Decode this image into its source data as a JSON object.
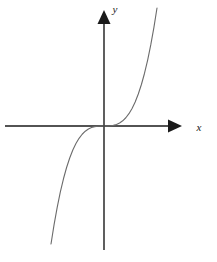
{
  "figure": {
    "width": 217,
    "height": 262,
    "background_color": "#ffffff"
  },
  "chart_data": {
    "type": "line",
    "title": "",
    "subtitle": "",
    "xlabel": "x",
    "ylabel": "y",
    "grid": false,
    "legend": null,
    "annotations": [],
    "tick_labels": {
      "x": [],
      "y": []
    },
    "axes": {
      "style": "arrowed-cartesian-axes",
      "origin_px": {
        "x": 104,
        "y": 126
      },
      "x_axis": {
        "start_px": {
          "x": 5,
          "y": 126
        },
        "end_px": {
          "x": 180,
          "y": 126
        },
        "arrowhead": "right",
        "color": "#1a1a1a",
        "label": "x",
        "label_pos_px": {
          "x": 203,
          "y": 128
        }
      },
      "y_axis": {
        "start_px": {
          "x": 104,
          "y": 250
        },
        "end_px": {
          "x": 104,
          "y": 14
        },
        "arrowhead": "up",
        "color": "#1a1a1a",
        "label": "y",
        "label_pos_px": {
          "x": 114,
          "y": 8
        }
      },
      "xlim": [
        -2.2,
        1.9
      ],
      "ylim": [
        -2.9,
        2.9
      ]
    },
    "series": [
      {
        "name": "y = x^3",
        "equation": "y = x^3",
        "color": "#6b6b6b",
        "line_width": 1.1,
        "x": [
          -1.9,
          -1.8,
          -1.7,
          -1.6,
          -1.5,
          -1.4,
          -1.3,
          -1.2,
          -1.1,
          -1.0,
          -0.9,
          -0.8,
          -0.7,
          -0.6,
          -0.5,
          -0.4,
          -0.3,
          -0.2,
          -0.1,
          0.0,
          0.1,
          0.2,
          0.3,
          0.4,
          0.5,
          0.6,
          0.7,
          0.8,
          0.9,
          1.0,
          1.1,
          1.2,
          1.3,
          1.4,
          1.5,
          1.6,
          1.7
        ],
        "y": [
          -6.859,
          -5.832,
          -4.913,
          -4.096,
          -3.375,
          -2.744,
          -2.197,
          -1.728,
          -1.331,
          -1.0,
          -0.729,
          -0.512,
          -0.343,
          -0.216,
          -0.125,
          -0.064,
          -0.027,
          -0.008,
          -0.001,
          0.0,
          0.001,
          0.008,
          0.027,
          0.064,
          0.125,
          0.216,
          0.343,
          0.512,
          0.729,
          1.0,
          1.331,
          1.728,
          2.197,
          2.744,
          3.375,
          4.096,
          4.913
        ]
      }
    ],
    "curve_path_px": "M 48,248 C 58,224 68,202 78,181 C 86,163 92,150 97,140 C 100,133 102,129 104,126 C 106,123 108,119 111,112 C 116,102 122,89 130,72 C 140,51 149,28 157,8",
    "curve_endpoints_px": {
      "lower_left": {
        "x": 48,
        "y": 248
      },
      "upper_right": {
        "x": 157,
        "y": 8
      },
      "inflection": {
        "x": 104,
        "y": 126
      }
    }
  }
}
